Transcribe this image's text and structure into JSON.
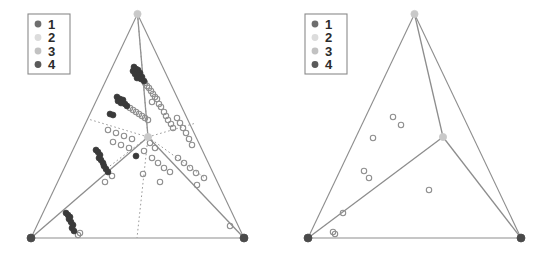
{
  "figure": {
    "type": "ternary-simplex-partition-pair",
    "background": "#ffffff",
    "panel_count": 2
  },
  "legend": {
    "name": "class-legend",
    "border_color": "#8a8a8a",
    "entries": [
      {
        "label": "1",
        "color": "#6e6e6e"
      },
      {
        "label": "2",
        "color": "#dcdcdc"
      },
      {
        "label": "3",
        "color": "#c2c2c2"
      },
      {
        "label": "4",
        "color": "#5a5a5a"
      }
    ]
  },
  "style": {
    "hull_line_color": "#8d8d8d",
    "partition_line_color": "#8d8d8d",
    "dotted_line_color": "#9a9a9a",
    "open_marker_stroke": "#8f8f8f",
    "filled_marker_dark": "#3a3a3a",
    "vertex_dark": "#4a4a4a",
    "vertex_light": "#c9c9c9"
  },
  "chart_data": {
    "type": "scatter",
    "title": "",
    "xlabel": "",
    "ylabel": "",
    "grid": false,
    "legend_position": "top-left",
    "panels": [
      {
        "name": "left-panel",
        "vertices": [
          {
            "name": "apex",
            "x": 137.5,
            "y": 14,
            "marker": "light"
          },
          {
            "name": "bottom-left",
            "x": 31,
            "y": 238,
            "marker": "dark"
          },
          {
            "name": "bottom-right",
            "x": 244,
            "y": 238,
            "marker": "dark"
          },
          {
            "name": "center",
            "x": 148,
            "y": 137,
            "marker": "light"
          }
        ],
        "hull_edges": [
          [
            137.5,
            14,
            31,
            238
          ],
          [
            31,
            238,
            244,
            238
          ],
          [
            244,
            238,
            137.5,
            14
          ]
        ],
        "partition_edges": [
          [
            137.5,
            14,
            148,
            137
          ],
          [
            148,
            137,
            31,
            238
          ],
          [
            148,
            137,
            244,
            238
          ]
        ],
        "dotted_edges": [
          [
            148,
            137,
            88,
            119
          ],
          [
            148,
            137,
            196,
            123
          ],
          [
            148,
            137,
            137,
            238
          ],
          [
            148,
            137,
            102,
            172
          ],
          [
            148,
            137,
            205,
            178
          ],
          [
            137.5,
            14,
            148,
            137
          ]
        ],
        "points_filled": [
          {
            "x": 134,
            "y": 67
          },
          {
            "x": 136,
            "y": 69
          },
          {
            "x": 138,
            "y": 70
          },
          {
            "x": 133,
            "y": 71
          },
          {
            "x": 137,
            "y": 72
          },
          {
            "x": 140,
            "y": 73
          },
          {
            "x": 135,
            "y": 74
          },
          {
            "x": 139,
            "y": 75
          },
          {
            "x": 142,
            "y": 77
          },
          {
            "x": 137,
            "y": 78
          },
          {
            "x": 141,
            "y": 79
          },
          {
            "x": 144,
            "y": 81
          },
          {
            "x": 117,
            "y": 97
          },
          {
            "x": 120,
            "y": 99
          },
          {
            "x": 123,
            "y": 100
          },
          {
            "x": 118,
            "y": 101
          },
          {
            "x": 121,
            "y": 103
          },
          {
            "x": 125,
            "y": 104
          },
          {
            "x": 127,
            "y": 106
          },
          {
            "x": 110,
            "y": 114
          },
          {
            "x": 113,
            "y": 115
          },
          {
            "x": 96,
            "y": 150
          },
          {
            "x": 98,
            "y": 152
          },
          {
            "x": 100,
            "y": 155
          },
          {
            "x": 99,
            "y": 158
          },
          {
            "x": 101,
            "y": 160
          },
          {
            "x": 103,
            "y": 163
          },
          {
            "x": 104,
            "y": 166
          },
          {
            "x": 106,
            "y": 169
          },
          {
            "x": 108,
            "y": 172
          },
          {
            "x": 66,
            "y": 213
          },
          {
            "x": 68,
            "y": 215
          },
          {
            "x": 70,
            "y": 217
          },
          {
            "x": 69,
            "y": 219
          },
          {
            "x": 71,
            "y": 222
          },
          {
            "x": 73,
            "y": 225
          },
          {
            "x": 72,
            "y": 228
          },
          {
            "x": 74,
            "y": 231
          },
          {
            "x": 136,
            "y": 156
          }
        ],
        "points_open": [
          {
            "x": 145,
            "y": 83
          },
          {
            "x": 147,
            "y": 86
          },
          {
            "x": 149,
            "y": 88
          },
          {
            "x": 151,
            "y": 91
          },
          {
            "x": 153,
            "y": 94
          },
          {
            "x": 155,
            "y": 97
          },
          {
            "x": 157,
            "y": 99
          },
          {
            "x": 152,
            "y": 102
          },
          {
            "x": 130,
            "y": 108
          },
          {
            "x": 133,
            "y": 110
          },
          {
            "x": 136,
            "y": 112
          },
          {
            "x": 139,
            "y": 114
          },
          {
            "x": 142,
            "y": 116
          },
          {
            "x": 145,
            "y": 118
          },
          {
            "x": 148,
            "y": 120
          },
          {
            "x": 159,
            "y": 104
          },
          {
            "x": 161,
            "y": 107
          },
          {
            "x": 164,
            "y": 112
          },
          {
            "x": 166,
            "y": 116
          },
          {
            "x": 168,
            "y": 120
          },
          {
            "x": 171,
            "y": 124
          },
          {
            "x": 173,
            "y": 128
          },
          {
            "x": 177,
            "y": 118
          },
          {
            "x": 180,
            "y": 123
          },
          {
            "x": 183,
            "y": 128
          },
          {
            "x": 186,
            "y": 133
          },
          {
            "x": 189,
            "y": 139
          },
          {
            "x": 192,
            "y": 145
          },
          {
            "x": 108,
            "y": 130
          },
          {
            "x": 116,
            "y": 133
          },
          {
            "x": 124,
            "y": 136
          },
          {
            "x": 132,
            "y": 139
          },
          {
            "x": 113,
            "y": 142
          },
          {
            "x": 121,
            "y": 145
          },
          {
            "x": 129,
            "y": 148
          },
          {
            "x": 144,
            "y": 151
          },
          {
            "x": 152,
            "y": 158
          },
          {
            "x": 158,
            "y": 163
          },
          {
            "x": 164,
            "y": 168
          },
          {
            "x": 170,
            "y": 172
          },
          {
            "x": 178,
            "y": 158
          },
          {
            "x": 184,
            "y": 163
          },
          {
            "x": 190,
            "y": 168
          },
          {
            "x": 196,
            "y": 173
          },
          {
            "x": 160,
            "y": 182
          },
          {
            "x": 197,
            "y": 185
          },
          {
            "x": 204,
            "y": 178
          },
          {
            "x": 112,
            "y": 176
          },
          {
            "x": 105,
            "y": 182
          },
          {
            "x": 78,
            "y": 235
          },
          {
            "x": 80,
            "y": 233
          },
          {
            "x": 230,
            "y": 226
          },
          {
            "x": 143,
            "y": 174
          },
          {
            "x": 150,
            "y": 143
          },
          {
            "x": 155,
            "y": 148
          }
        ]
      },
      {
        "name": "right-panel",
        "vertices": [
          {
            "name": "apex",
            "x": 137.5,
            "y": 14,
            "marker": "light"
          },
          {
            "name": "bottom-left",
            "x": 31,
            "y": 238,
            "marker": "dark"
          },
          {
            "name": "bottom-right",
            "x": 244,
            "y": 238,
            "marker": "dark"
          },
          {
            "name": "center",
            "x": 166,
            "y": 137,
            "marker": "light"
          }
        ],
        "hull_edges": [
          [
            137.5,
            14,
            31,
            238
          ],
          [
            31,
            238,
            244,
            238
          ],
          [
            244,
            238,
            137.5,
            14
          ]
        ],
        "partition_edges": [
          [
            137.5,
            14,
            166,
            137
          ],
          [
            166,
            137,
            31,
            238
          ],
          [
            166,
            137,
            244,
            238
          ]
        ],
        "dotted_edges": [],
        "points_filled": [],
        "points_open": [
          {
            "x": 116,
            "y": 117
          },
          {
            "x": 124,
            "y": 125
          },
          {
            "x": 96,
            "y": 138
          },
          {
            "x": 87,
            "y": 171
          },
          {
            "x": 92,
            "y": 178
          },
          {
            "x": 152,
            "y": 190
          },
          {
            "x": 66,
            "y": 213
          },
          {
            "x": 56,
            "y": 232
          },
          {
            "x": 58,
            "y": 234
          }
        ]
      }
    ]
  }
}
